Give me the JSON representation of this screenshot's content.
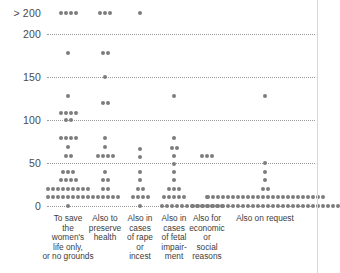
{
  "chart_data": {
    "type": "scatter",
    "title": "",
    "subtitle": "",
    "xlabel": "",
    "ylabel": "",
    "grid": true,
    "legend": "none",
    "ylim": [
      0,
      200
    ],
    "yticks": [
      {
        "label": "> 200",
        "value": 215
      },
      {
        "label": "200",
        "value": 200
      },
      {
        "label": "150",
        "value": 150
      },
      {
        "label": "100",
        "value": 100
      },
      {
        "label": "50",
        "value": 50
      },
      {
        "label": "0",
        "value": 0
      }
    ],
    "overflow_tick_label": "> 200",
    "categories": [
      "To save\nthe\nwomen's\nlife only,\nor no grounds",
      "Also to\npreserve\nhealth",
      "Also in\ncases\nof rape\nor\nincest",
      "Also in\ncases\nof fetal\nimpair-\nment",
      "Also for\neconomic\nor\nsocial\nreasons",
      "Also on request"
    ],
    "series": [
      {
        "name": "To save the women's life only, or no grounds",
        "stacks": [
          {
            "value": 215,
            "count": 4
          },
          {
            "value": 178,
            "count": 1
          },
          {
            "value": 128,
            "count": 1
          },
          {
            "value": 108,
            "count": 4
          },
          {
            "value": 100,
            "count": 2
          },
          {
            "value": 79,
            "count": 4
          },
          {
            "value": 69,
            "count": 1
          },
          {
            "value": 58,
            "count": 2
          },
          {
            "value": 40,
            "count": 3
          },
          {
            "value": 30,
            "count": 4
          },
          {
            "value": 20,
            "count": 9
          },
          {
            "value": 10,
            "count": 9
          },
          {
            "value": 0,
            "count": 1
          }
        ]
      },
      {
        "name": "Also to preserve health",
        "stacks": [
          {
            "value": 215,
            "count": 3
          },
          {
            "value": 178,
            "count": 2
          },
          {
            "value": 150,
            "count": 1
          },
          {
            "value": 120,
            "count": 2
          },
          {
            "value": 79,
            "count": 1
          },
          {
            "value": 69,
            "count": 1
          },
          {
            "value": 58,
            "count": 4
          },
          {
            "value": 40,
            "count": 1
          },
          {
            "value": 30,
            "count": 2
          },
          {
            "value": 20,
            "count": 2
          },
          {
            "value": 10,
            "count": 6
          }
        ]
      },
      {
        "name": "Also in cases of rape or incest",
        "stacks": [
          {
            "value": 215,
            "count": 1
          },
          {
            "value": 66,
            "count": 1
          },
          {
            "value": 57,
            "count": 1
          },
          {
            "value": 40,
            "count": 1
          },
          {
            "value": 30,
            "count": 1
          },
          {
            "value": 20,
            "count": 2
          },
          {
            "value": 10,
            "count": 4
          },
          {
            "value": 0,
            "count": 1
          }
        ]
      },
      {
        "name": "Also in cases of fetal impairment",
        "stacks": [
          {
            "value": 128,
            "count": 1
          },
          {
            "value": 79,
            "count": 1
          },
          {
            "value": 68,
            "count": 2
          },
          {
            "value": 58,
            "count": 1
          },
          {
            "value": 49,
            "count": 1
          },
          {
            "value": 40,
            "count": 1
          },
          {
            "value": 30,
            "count": 1
          },
          {
            "value": 20,
            "count": 3
          },
          {
            "value": 10,
            "count": 5
          },
          {
            "value": 0,
            "count": 6
          }
        ]
      },
      {
        "name": "Also for economic or social reasons",
        "stacks": [
          {
            "value": 58,
            "count": 3
          },
          {
            "value": 10,
            "count": 1
          },
          {
            "value": 0,
            "count": 7
          }
        ]
      },
      {
        "name": "Also on request",
        "stacks": [
          {
            "value": 128,
            "count": 1
          },
          {
            "value": 50,
            "count": 1
          },
          {
            "value": 40,
            "count": 1
          },
          {
            "value": 30,
            "count": 1
          },
          {
            "value": 20,
            "count": 2
          },
          {
            "value": 10,
            "count": 24
          },
          {
            "value": 0,
            "count": 30
          }
        ]
      }
    ],
    "colors": {
      "dot": "#7d7d7d",
      "gridline": "#9a9a9a",
      "tick_text": "#4a4a4a",
      "label_text": "#3c3c3c",
      "background": "#ffffff",
      "rule": "#d8d8d8"
    }
  }
}
